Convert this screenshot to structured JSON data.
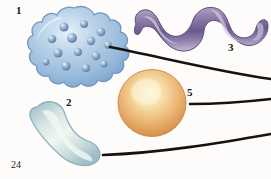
{
  "page": {
    "number": "24",
    "background_color": "#fdfcfa",
    "width": 271,
    "height": 179
  },
  "figure": {
    "type": "scientific-illustration",
    "organisms": [
      {
        "id": "organism-1",
        "label": "1",
        "name": "amoeba-lobed-cell",
        "shape": "irregular-lobed-blob",
        "color": "#9fc0dd",
        "outline_color": "#6b8fb5",
        "highlight_color": "#dcebf7",
        "granule_color": "#6f8fb4",
        "granule_count": 14,
        "center_x": 78,
        "center_y": 45,
        "radius_x": 52,
        "radius_y": 40
      },
      {
        "id": "organism-2",
        "label": "2",
        "name": "bacillus-bean-rod",
        "shape": "curved-rod",
        "color": "#c3d5da",
        "outline_color": "#8fb0bb",
        "highlight_color": "#eef5f3",
        "center_x": 63,
        "center_y": 131,
        "radius_x": 40,
        "radius_y": 28
      },
      {
        "id": "organism-3",
        "label": "3",
        "name": "spirochete-spiral",
        "shape": "helical-ribbon",
        "color": "#8f7fa8",
        "outline_color": "#5e4f78",
        "highlight_color": "#cfc3dd",
        "center_x": 192,
        "center_y": 33,
        "radius_x": 62,
        "radius_y": 28
      },
      {
        "id": "organism-5",
        "label": "5",
        "name": "coccus-sphere",
        "shape": "sphere",
        "color": "#e3a86a",
        "outline_color": "#c98c4e",
        "highlight_color": "#fdf4d8",
        "center_x": 152,
        "center_y": 103,
        "radius": 34
      }
    ],
    "leader_lines": [
      {
        "id": "leader-line-top",
        "name": "leader-line-from-amoeba",
        "color": "#17120f",
        "width": 2.6,
        "path": "M 110 47 C 165 58, 220 72, 271 79"
      },
      {
        "id": "leader-line-middle",
        "name": "leader-line-from-coccus",
        "color": "#17120f",
        "width": 2.6,
        "path": "M 190 104 C 215 104, 245 102, 271 99"
      },
      {
        "id": "leader-line-bottom",
        "name": "leader-line-from-bacillus",
        "color": "#17120f",
        "width": 2.6,
        "path": "M 103 155 C 160 153, 220 143, 271 134"
      }
    ],
    "labels": [
      {
        "id": "label-1",
        "text": "1",
        "for": "organism-1"
      },
      {
        "id": "label-2",
        "text": "2",
        "for": "organism-2"
      },
      {
        "id": "label-3",
        "text": "3",
        "for": "organism-3"
      },
      {
        "id": "label-5",
        "text": "5",
        "for": "organism-5"
      }
    ]
  },
  "colors": {
    "ink": "#17120f",
    "paper": "#fdfcfa",
    "amoeba_blue": "#9fc0dd",
    "bacillus_green": "#c3d5da",
    "spiral_purple": "#8f7fa8",
    "coccus_orange": "#e3a86a"
  }
}
